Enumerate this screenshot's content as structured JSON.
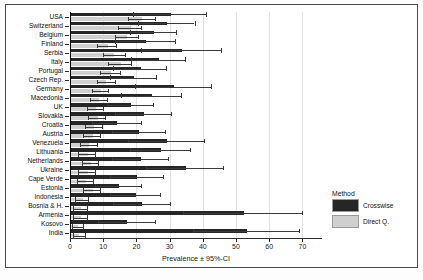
{
  "figure": {
    "xlabel": "Prevalence ± 95%-CI",
    "xticks": [
      0,
      10,
      20,
      30,
      40,
      50,
      60,
      70
    ]
  },
  "legend": {
    "title": "Method",
    "items": [
      {
        "label": "Crosswise",
        "color": "#262626",
        "key": "crosswise"
      },
      {
        "label": "Direct Q.",
        "color": "#cfcfcf",
        "key": "direct"
      }
    ]
  },
  "chart_data": {
    "type": "bar",
    "orientation": "horizontal",
    "title": "",
    "xlabel": "Prevalence ± 95%-CI",
    "ylabel": "",
    "xlim": [
      0,
      76
    ],
    "grid": true,
    "legend_position": "right-bottom",
    "categories": [
      "USA",
      "Switzerland",
      "Belgium",
      "Finland",
      "Serbia",
      "Italy",
      "Portugal",
      "Czech Rep.",
      "Germany",
      "Macedonia",
      "UK",
      "Slovakia",
      "Croatia",
      "Austria",
      "Venezuela",
      "Lithuania",
      "Netherlands",
      "Ukraine",
      "Cape Verde",
      "Estonia",
      "Indonesia",
      "Bosnia & H.",
      "Armenia",
      "Kosovo",
      "India"
    ],
    "series": [
      {
        "name": "Crosswise",
        "color": "#262626",
        "values": [
          30.0,
          29.0,
          25.0,
          22.5,
          33.5,
          26.5,
          21.0,
          19.0,
          31.0,
          24.5,
          18.0,
          22.0,
          14.0,
          20.5,
          29.0,
          27.0,
          21.0,
          34.5,
          20.0,
          14.5,
          19.5,
          21.5,
          52.0,
          17.0,
          53.0
        ],
        "ci_upper": [
          41.0,
          37.5,
          32.0,
          31.5,
          45.5,
          34.5,
          29.0,
          26.0,
          42.5,
          33.5,
          25.0,
          30.5,
          21.5,
          28.5,
          40.5,
          36.0,
          29.5,
          46.0,
          28.0,
          21.5,
          27.0,
          30.0,
          70.0,
          25.5,
          69.0
        ],
        "ci_lower": [
          19.0,
          20.5,
          18.0,
          13.5,
          21.5,
          18.5,
          13.0,
          12.0,
          19.5,
          15.5,
          11.0,
          13.5,
          6.5,
          12.5,
          17.5,
          18.0,
          12.5,
          23.0,
          12.0,
          7.5,
          12.0,
          13.0,
          34.0,
          8.5,
          37.0
        ]
      },
      {
        "name": "Direct Q.",
        "color": "#cfcfcf",
        "values": [
          21.5,
          18.0,
          17.0,
          11.0,
          13.0,
          15.0,
          12.0,
          10.5,
          9.0,
          8.5,
          7.5,
          8.0,
          7.0,
          6.5,
          5.5,
          5.0,
          6.0,
          5.0,
          4.5,
          6.5,
          3.5,
          3.0,
          3.0,
          2.0,
          2.5
        ],
        "ci_upper": [
          25.5,
          21.5,
          20.5,
          14.0,
          16.5,
          18.5,
          15.0,
          13.5,
          11.5,
          11.0,
          10.0,
          10.5,
          9.5,
          9.0,
          8.0,
          7.5,
          8.5,
          7.5,
          7.0,
          9.0,
          5.5,
          5.0,
          5.0,
          4.0,
          4.5
        ],
        "ci_lower": [
          17.5,
          14.5,
          13.5,
          8.0,
          10.0,
          11.5,
          9.0,
          8.0,
          6.5,
          6.0,
          5.0,
          5.5,
          4.5,
          4.0,
          3.0,
          2.5,
          3.5,
          2.5,
          2.0,
          4.0,
          1.5,
          1.0,
          1.0,
          0.5,
          0.8
        ]
      }
    ]
  }
}
